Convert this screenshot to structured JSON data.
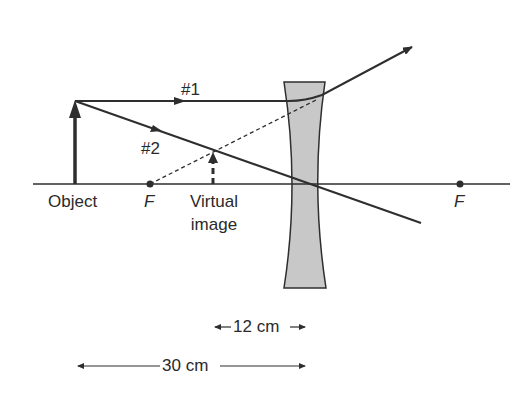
{
  "diagram": {
    "labels": {
      "ray1": "#1",
      "ray2": "#2",
      "object": "Object",
      "focal_left": "F",
      "focal_right": "F",
      "virtual_image_line1": "Virtual",
      "virtual_image_line2": "image",
      "dimension_12": "12 cm",
      "dimension_30": "30 cm"
    },
    "colors": {
      "line": "#2e2e2e",
      "lens_fill": "#c8c8c8",
      "background": "#ffffff"
    },
    "geometry": {
      "object_distance_cm": 30,
      "image_distance_cm": 12,
      "element_count": {
        "lens": 1,
        "rays": 2,
        "focal_points": 2
      }
    }
  }
}
